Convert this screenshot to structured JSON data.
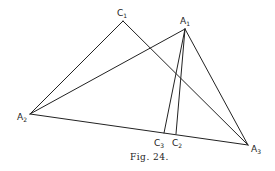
{
  "figure": {
    "caption": "Fig. 24.",
    "points": {
      "C1": {
        "label": "C",
        "sub": "1",
        "x": 123,
        "y": 21
      },
      "A1": {
        "label": "A",
        "sub": "1",
        "x": 185,
        "y": 29
      },
      "A2": {
        "label": "A",
        "sub": "2",
        "x": 30,
        "y": 114
      },
      "A3": {
        "label": "A",
        "sub": "3",
        "x": 248,
        "y": 145
      },
      "C3": {
        "label": "C",
        "sub": "3",
        "x": 164,
        "y": 133
      },
      "C2": {
        "label": "C",
        "sub": "2",
        "x": 176,
        "y": 134
      }
    },
    "segments": [
      [
        "A2",
        "C1"
      ],
      [
        "C1",
        "A3"
      ],
      [
        "A2",
        "A1"
      ],
      [
        "A1",
        "A3"
      ],
      [
        "A2",
        "A3"
      ],
      [
        "A1",
        "C3"
      ],
      [
        "A1",
        "C2"
      ]
    ]
  }
}
